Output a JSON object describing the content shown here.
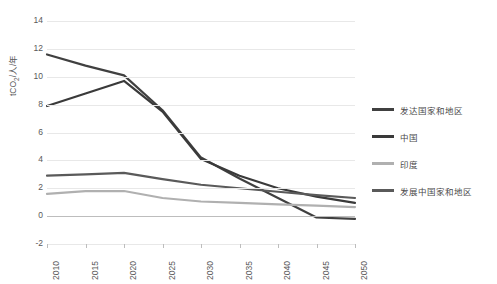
{
  "chart_data": {
    "type": "line",
    "title": "",
    "xlabel": "",
    "ylabel": "tCO2/人/年",
    "ylabel_html": "tCO<sub>2</sub>/人/年",
    "categories": [
      "2010",
      "2015",
      "2020",
      "2025",
      "2030",
      "2035",
      "2040",
      "2045",
      "2050"
    ],
    "x": [
      2010,
      2015,
      2020,
      2025,
      2030,
      2035,
      2040,
      2045,
      2050
    ],
    "ylim": [
      -2,
      14
    ],
    "yticks": [
      "14",
      "12",
      "10",
      "8",
      "6",
      "4",
      "2",
      "0",
      "-2"
    ],
    "ytick_values": [
      14,
      12,
      10,
      8,
      6,
      4,
      2,
      0,
      -2
    ],
    "grid": true,
    "legend_position": "right",
    "series": [
      {
        "name": "发达国家和地区",
        "color": "#404040",
        "values": [
          11.6,
          10.8,
          10.1,
          7.6,
          4.2,
          2.7,
          1.3,
          -0.1,
          -0.2
        ]
      },
      {
        "name": "中国",
        "color": "#3a3a3a",
        "values": [
          7.9,
          8.8,
          9.7,
          7.5,
          4.1,
          2.9,
          2.0,
          1.4,
          0.95
        ]
      },
      {
        "name": "印度",
        "color": "#b0b0b0",
        "values": [
          1.6,
          1.8,
          1.8,
          1.3,
          1.05,
          0.95,
          0.85,
          0.75,
          0.65
        ]
      },
      {
        "name": "发展中国家和地区",
        "color": "#5a5a5a",
        "values": [
          2.9,
          3.0,
          3.1,
          2.65,
          2.25,
          2.0,
          1.75,
          1.5,
          1.3
        ]
      }
    ]
  },
  "legend": {
    "items": [
      {
        "label": "发达国家和地区"
      },
      {
        "label": "中国"
      },
      {
        "label": "印度"
      },
      {
        "label": "发展中国家和地区"
      }
    ]
  },
  "caption": ""
}
